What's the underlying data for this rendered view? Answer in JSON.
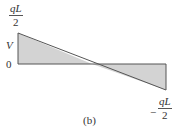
{
  "diagram": {
    "caption": "(b)",
    "axis_label": "V",
    "zero_label": "0",
    "max_label": {
      "numerator": "qL",
      "denominator": "2",
      "sign": ""
    },
    "min_label": {
      "numerator": "qL",
      "denominator": "2",
      "sign": "−"
    },
    "fill_color": "#d3d3d3",
    "line_color": "#555555"
  }
}
